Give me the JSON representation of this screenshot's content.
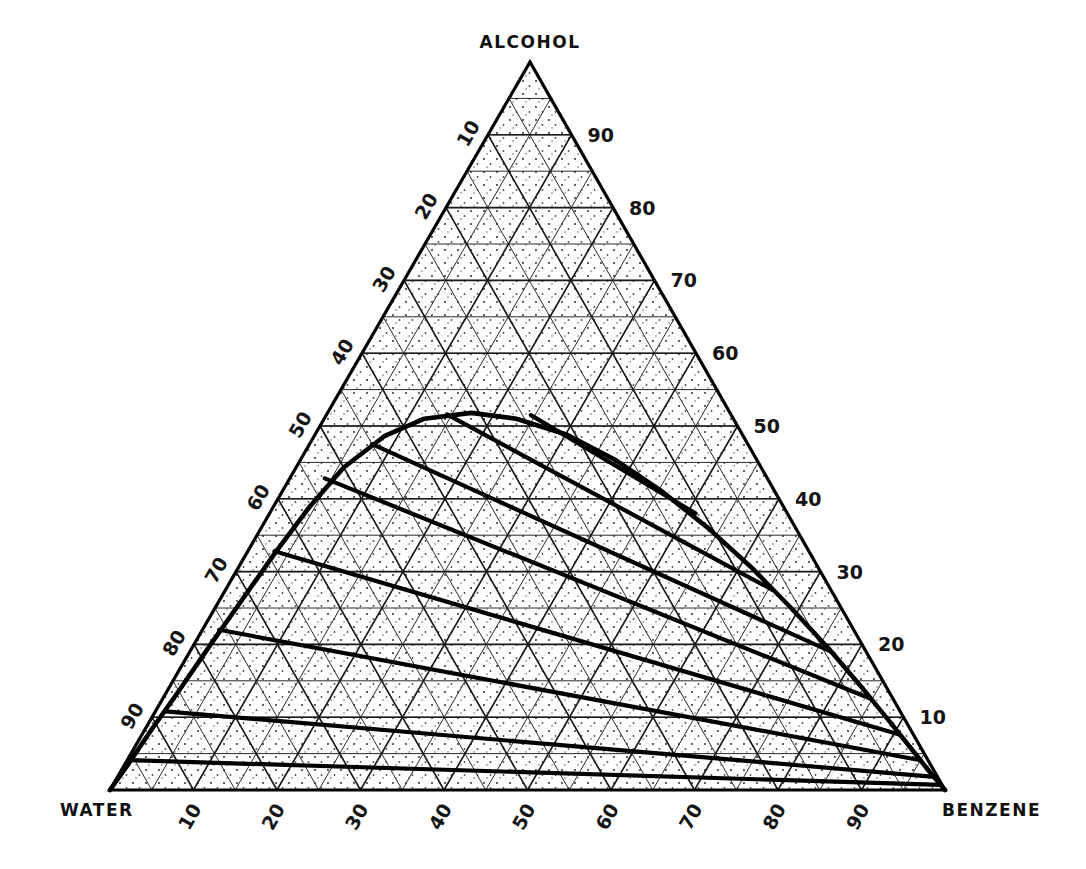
{
  "figure": {
    "kind": "ternary-phase-diagram",
    "background_color": "#ffffff",
    "line_color": "#000000",
    "stipple_color": "#333333"
  },
  "corners": {
    "top": "ALCOHOL",
    "bottom_left": "WATER",
    "bottom_right": "BENZENE"
  },
  "axes": {
    "left": {
      "name": "alcohol-left-axis",
      "ticks": [
        "10",
        "20",
        "30",
        "40",
        "50",
        "60",
        "70",
        "80",
        "90"
      ],
      "rotated": true
    },
    "right": {
      "name": "alcohol-right-axis",
      "ticks": [
        "90",
        "80",
        "70",
        "60",
        "50",
        "40",
        "30",
        "20",
        "10"
      ],
      "rotated": false
    },
    "bottom": {
      "name": "water-benzene-axis",
      "ticks": [
        "10",
        "20",
        "30",
        "40",
        "50",
        "60",
        "70",
        "80",
        "90"
      ],
      "rotated": true
    }
  },
  "chart_data": {
    "type": "scatter",
    "title": "",
    "subtitle": "",
    "xlabel": "",
    "ylabel": "",
    "components": [
      "WATER",
      "ALCOHOL",
      "BENZENE"
    ],
    "grid": true,
    "grid_interval": 10,
    "axis_range": [
      0,
      100
    ],
    "legend_position": "none",
    "annotations": [],
    "binodal_curve": {
      "label": "binodal (solubility) curve",
      "points": [
        [
          100.0,
          0.0,
          0.0
        ],
        [
          96.0,
          3.6,
          0.4
        ],
        [
          91.0,
          8.2,
          0.8
        ],
        [
          85.0,
          13.6,
          1.4
        ],
        [
          78.0,
          20.0,
          2.0
        ],
        [
          71.0,
          26.3,
          2.7
        ],
        [
          64.0,
          32.6,
          3.4
        ],
        [
          57.0,
          38.7,
          4.3
        ],
        [
          50.0,
          44.3,
          5.7
        ],
        [
          43.0,
          48.6,
          8.4
        ],
        [
          37.0,
          51.0,
          12.0
        ],
        [
          31.0,
          51.8,
          17.2
        ],
        [
          26.0,
          51.0,
          23.0
        ],
        [
          21.0,
          48.8,
          30.2
        ],
        [
          17.0,
          45.4,
          37.6
        ],
        [
          13.5,
          41.0,
          45.5
        ],
        [
          10.5,
          36.0,
          53.5
        ],
        [
          8.0,
          30.6,
          61.4
        ],
        [
          6.0,
          25.0,
          69.0
        ],
        [
          4.3,
          19.5,
          76.2
        ],
        [
          3.0,
          14.3,
          82.7
        ],
        [
          2.0,
          9.6,
          88.4
        ],
        [
          1.2,
          5.6,
          93.2
        ],
        [
          0.6,
          2.5,
          96.9
        ],
        [
          0.0,
          0.0,
          100.0
        ]
      ]
    },
    "tie_lines": [
      {
        "id": "tie-line-1",
        "water_rich_end": [
          24.0,
          51.5,
          24.5
        ],
        "benzene_rich_end": [
          11.0,
          38.0,
          51.0
        ]
      },
      {
        "id": "tie-line-2",
        "water_rich_end": [
          34.0,
          51.6,
          14.4
        ],
        "benzene_rich_end": [
          7.0,
          27.5,
          65.5
        ]
      },
      {
        "id": "tie-line-3",
        "water_rich_end": [
          45.0,
          47.5,
          7.5
        ],
        "benzene_rich_end": [
          4.2,
          19.0,
          76.8
        ]
      },
      {
        "id": "tie-line-4",
        "water_rich_end": [
          53.0,
          42.8,
          4.2
        ],
        "benzene_rich_end": [
          2.6,
          12.5,
          84.9
        ]
      },
      {
        "id": "tie-line-5",
        "water_rich_end": [
          64.0,
          32.8,
          3.2
        ],
        "benzene_rich_end": [
          1.6,
          7.6,
          90.8
        ]
      },
      {
        "id": "tie-line-6",
        "water_rich_end": [
          76.0,
          22.0,
          2.0
        ],
        "benzene_rich_end": [
          0.9,
          4.1,
          95.0
        ]
      },
      {
        "id": "tie-line-7",
        "water_rich_end": [
          88.0,
          10.8,
          1.2
        ],
        "benzene_rich_end": [
          0.4,
          1.8,
          97.8
        ]
      },
      {
        "id": "tie-line-8",
        "water_rich_end": [
          95.5,
          4.1,
          0.4
        ],
        "benzene_rich_end": [
          0.2,
          0.7,
          99.1
        ]
      }
    ]
  }
}
